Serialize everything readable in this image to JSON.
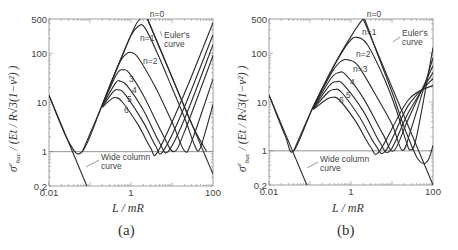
{
  "figure": {
    "panels": [
      {
        "caption": "(a)",
        "xlabel": "L / mR",
        "ylabel_main": "σ",
        "ylabel_sup": "e",
        "ylabel_sub": "buc",
        "ylabel_rest": " / (Et / R√3(1−ν²) )",
        "annotations": {
          "n0": "n=0",
          "n1": "n=1",
          "n2": "n=2",
          "n3": "3",
          "n4": "4",
          "n5": "5",
          "n6": "6",
          "euler_line1": "Euler's",
          "euler_line2": "curve",
          "wide_line1": "Wide column",
          "wide_line2": "curve"
        }
      },
      {
        "caption": "(b)",
        "xlabel": "L / mR",
        "ylabel_main": "σ",
        "ylabel_sup": "e",
        "ylabel_sub": "buc",
        "ylabel_rest": " / (Et / R√3(1−ν²) )",
        "annotations": {
          "n0": "n=0",
          "n1": "n=1",
          "n2": "n=2",
          "n3": "n=3",
          "n4": "4",
          "n5": "5",
          "n6": "6",
          "euler_line1": "Euler's",
          "euler_line2": "curve",
          "wide_line1": "Wide column",
          "wide_line2": "curve"
        }
      }
    ]
  },
  "chart_data": [
    {
      "type": "line",
      "title": "(a)",
      "xlabel": "L / mR",
      "ylabel": "σ^e_buc / (Et / R√3(1−ν²))",
      "xscale": "log",
      "yscale": "log",
      "xlim": [
        0.01,
        100
      ],
      "ylim": [
        0.2,
        500
      ],
      "xticks": [
        0.01,
        1,
        100
      ],
      "yticks": [
        0.2,
        1,
        10,
        100,
        500
      ],
      "grid": false,
      "reference_line_y": 1,
      "series": [
        {
          "name": "n=0",
          "points": [
            [
              0.01,
              14
            ],
            [
              0.03,
              1.6
            ],
            [
              0.065,
              1
            ],
            [
              0.2,
              9
            ],
            [
              0.5,
              60
            ],
            [
              1.2,
              330
            ],
            [
              1.7,
              500
            ],
            [
              2.5,
              500
            ],
            [
              3.0,
              360
            ],
            [
              10,
              33
            ],
            [
              30,
              3.7
            ],
            [
              70,
              1
            ]
          ]
        },
        {
          "name": "n=1",
          "points": [
            [
              0.065,
              1
            ],
            [
              0.2,
              9
            ],
            [
              0.5,
              60
            ],
            [
              1.0,
              230
            ],
            [
              1.6,
              370
            ],
            [
              2.2,
              330
            ],
            [
              4,
              120
            ],
            [
              10,
              20
            ],
            [
              20,
              5
            ],
            [
              35,
              1.4
            ],
            [
              45,
              1.05
            ],
            [
              60,
              2
            ],
            [
              100,
              9
            ]
          ]
        },
        {
          "name": "n=2",
          "points": [
            [
              0.2,
              9
            ],
            [
              0.5,
              60
            ],
            [
              0.8,
              100
            ],
            [
              1.1,
              102
            ],
            [
              1.6,
              75
            ],
            [
              4,
              20
            ],
            [
              10,
              4
            ],
            [
              20,
              1.05
            ],
            [
              30,
              1.6
            ],
            [
              100,
              30
            ]
          ]
        },
        {
          "name": "n=3",
          "points": [
            [
              0.2,
              8.8
            ],
            [
              0.45,
              38
            ],
            [
              0.65,
              46
            ],
            [
              0.9,
              40
            ],
            [
              2,
              14
            ],
            [
              6,
              2.2
            ],
            [
              11,
              1
            ],
            [
              20,
              2.5
            ],
            [
              100,
              90
            ]
          ]
        },
        {
          "name": "n=4",
          "points": [
            [
              0.2,
              8.5
            ],
            [
              0.42,
              25
            ],
            [
              0.55,
              27
            ],
            [
              0.8,
              22
            ],
            [
              2,
              7
            ],
            [
              5,
              1.5
            ],
            [
              8,
              1
            ],
            [
              20,
              4.5
            ],
            [
              100,
              150
            ]
          ]
        },
        {
          "name": "n=5",
          "points": [
            [
              0.2,
              8.2
            ],
            [
              0.38,
              17
            ],
            [
              0.5,
              18
            ],
            [
              0.7,
              15
            ],
            [
              2,
              4
            ],
            [
              4,
              1.3
            ],
            [
              6,
              1
            ],
            [
              20,
              8
            ],
            [
              100,
              240
            ]
          ]
        },
        {
          "name": "n=6",
          "points": [
            [
              0.2,
              8
            ],
            [
              0.34,
              12
            ],
            [
              0.43,
              12.5
            ],
            [
              0.6,
              10.5
            ],
            [
              1.5,
              3.5
            ],
            [
              3,
              1.2
            ],
            [
              4.5,
              1
            ],
            [
              20,
              15
            ],
            [
              100,
              420
            ]
          ]
        },
        {
          "name": "Euler's curve",
          "points": [
            [
              2.5,
              500
            ],
            [
              100,
              0.35
            ]
          ]
        },
        {
          "name": "Wide column curve",
          "points": [
            [
              0.01,
              14
            ],
            [
              0.0837,
              0.2
            ]
          ]
        }
      ]
    },
    {
      "type": "line",
      "title": "(b)",
      "xlabel": "L / mR",
      "ylabel": "σ^e_buc / (Et / R√3(1−ν²))",
      "xscale": "log",
      "yscale": "log",
      "xlim": [
        0.01,
        100
      ],
      "ylim": [
        0.2,
        500
      ],
      "xticks": [
        0.01,
        1,
        100
      ],
      "yticks": [
        0.2,
        1,
        10,
        100,
        500
      ],
      "grid": false,
      "reference_line_y": 1,
      "series": [
        {
          "name": "n=0",
          "points": [
            [
              0.01,
              14
            ],
            [
              0.025,
              2
            ],
            [
              0.04,
              1
            ],
            [
              0.12,
              8
            ],
            [
              0.4,
              60
            ],
            [
              1.2,
              280
            ],
            [
              2.0,
              500
            ],
            [
              2.3,
              430
            ],
            [
              4,
              120
            ],
            [
              10,
              16
            ],
            [
              20,
              3
            ],
            [
              40,
              0.75
            ],
            [
              60,
              0.55
            ],
            [
              80,
              0.7
            ],
            [
              100,
              1.3
            ]
          ]
        },
        {
          "name": "n=1",
          "points": [
            [
              0.04,
              1
            ],
            [
              0.12,
              8
            ],
            [
              0.4,
              58
            ],
            [
              0.9,
              170
            ],
            [
              1.4,
              210
            ],
            [
              2.5,
              150
            ],
            [
              6,
              35
            ],
            [
              12,
              8
            ],
            [
              22,
              1.6
            ],
            [
              28,
              1.05
            ],
            [
              40,
              2
            ],
            [
              100,
              130
            ]
          ]
        },
        {
          "name": "n=2",
          "points": [
            [
              0.12,
              7.8
            ],
            [
              0.35,
              42
            ],
            [
              0.6,
              70
            ],
            [
              0.9,
              72
            ],
            [
              1.5,
              55
            ],
            [
              4,
              14
            ],
            [
              10,
              3.5
            ],
            [
              18,
              1.02
            ],
            [
              30,
              3
            ],
            [
              100,
              80
            ]
          ]
        },
        {
          "name": "n=3",
          "points": [
            [
              0.12,
              7.6
            ],
            [
              0.32,
              30
            ],
            [
              0.5,
              40
            ],
            [
              0.75,
              36
            ],
            [
              2,
              12
            ],
            [
              6,
              2.2
            ],
            [
              11,
              1
            ],
            [
              25,
              4.5
            ],
            [
              100,
              55
            ]
          ]
        },
        {
          "name": "n=4",
          "points": [
            [
              0.12,
              7.4
            ],
            [
              0.3,
              22
            ],
            [
              0.45,
              26
            ],
            [
              0.65,
              23
            ],
            [
              2,
              6.5
            ],
            [
              5,
              1.5
            ],
            [
              9,
              1
            ],
            [
              25,
              6
            ],
            [
              100,
              40
            ]
          ]
        },
        {
          "name": "n=5",
          "points": [
            [
              0.12,
              7.2
            ],
            [
              0.28,
              16
            ],
            [
              0.4,
              18
            ],
            [
              0.58,
              16
            ],
            [
              1.6,
              5
            ],
            [
              4,
              1.3
            ],
            [
              7,
              1
            ],
            [
              25,
              8.5
            ],
            [
              100,
              30
            ]
          ]
        },
        {
          "name": "n=6",
          "points": [
            [
              0.12,
              7
            ],
            [
              0.26,
              11.5
            ],
            [
              0.36,
              12.5
            ],
            [
              0.52,
              11
            ],
            [
              1.3,
              4
            ],
            [
              3,
              1.2
            ],
            [
              5,
              1
            ],
            [
              25,
              11
            ],
            [
              100,
              22
            ]
          ]
        },
        {
          "name": "Euler's curve",
          "points": [
            [
              2.0,
              500
            ],
            [
              100,
              0.2
            ]
          ]
        },
        {
          "name": "Wide column curve",
          "points": [
            [
              0.01,
              14
            ],
            [
              0.0837,
              0.2
            ]
          ]
        }
      ]
    }
  ]
}
